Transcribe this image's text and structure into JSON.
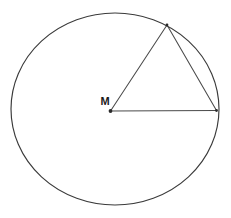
{
  "figure": {
    "background_color": "#ffffff",
    "stroke_color": "#3a3a3a",
    "label_color": "#1a1a1a",
    "width": 231,
    "height": 218
  },
  "circle": {
    "name": "circle-outline",
    "center_x": 115,
    "center_y": 109,
    "radius_x": 104,
    "radius_y": 96,
    "stroke_width": 1.15
  },
  "points": [
    {
      "id": "center",
      "label": "M",
      "x": 110.5,
      "y": 111,
      "label_x": 105,
      "label_y": 102,
      "dot_radius": 1.9,
      "show_dot": true,
      "show_label": true
    },
    {
      "id": "apex",
      "label": "",
      "x": 167,
      "y": 25,
      "label_x": 167,
      "label_y": 18,
      "dot_radius": 1.4,
      "show_dot": true,
      "show_label": false
    },
    {
      "id": "right",
      "label": "",
      "x": 216.5,
      "y": 110.5,
      "label_x": 221,
      "label_y": 104,
      "dot_radius": 1.4,
      "show_dot": true,
      "show_label": false
    }
  ],
  "segments": [
    {
      "id": "radius-horizontal",
      "name": "radius-to-right-point",
      "from": "center",
      "to": "right",
      "x1": 110.5,
      "y1": 111,
      "x2": 216.5,
      "y2": 110.5
    },
    {
      "id": "radius-oblique",
      "name": "radius-to-apex-point",
      "from": "center",
      "to": "apex",
      "x1": 110.5,
      "y1": 111,
      "x2": 167,
      "y2": 25
    },
    {
      "id": "chord",
      "name": "chord-apex-to-right",
      "from": "apex",
      "to": "right",
      "x1": 167,
      "y1": 25,
      "x2": 216.5,
      "y2": 110.5
    }
  ]
}
